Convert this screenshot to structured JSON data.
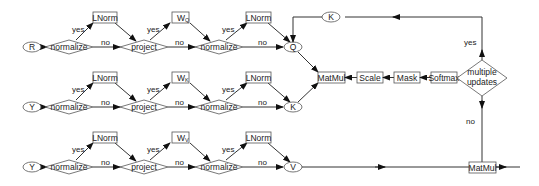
{
  "diagram": {
    "rows": [
      {
        "input": "R",
        "output": "Q",
        "weight": "W",
        "weight_sub": "Q",
        "y": 47
      },
      {
        "input": "Y",
        "output": "K",
        "weight": "W",
        "weight_sub": "K",
        "y": 107
      },
      {
        "input": "Y",
        "output": "V",
        "weight": "W",
        "weight_sub": "V",
        "y": 167
      }
    ],
    "decisions": {
      "normalize": "normalize",
      "project": "project",
      "multiple_updates_1": "multiple",
      "multiple_updates_2": "updates"
    },
    "boxes": {
      "lnorm": "LNorm",
      "matmul": "MatMul",
      "scale": "Scale",
      "mask": "Mask",
      "softmax": "Softmax",
      "matmul_out": "MatMul"
    },
    "feedback_node": "K",
    "edge_labels": {
      "yes": "yes",
      "no": "no"
    }
  }
}
